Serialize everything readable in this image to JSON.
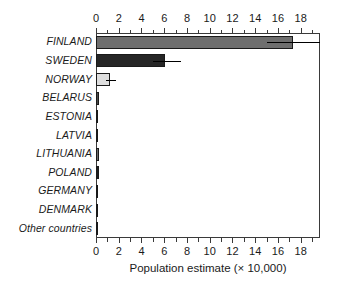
{
  "chart_data": {
    "type": "bar",
    "orientation": "horizontal",
    "title": "",
    "xlabel": "Population estimate (× 10,000)",
    "ylabel": "",
    "xlim": [
      0,
      19.7
    ],
    "grid": false,
    "legend": null,
    "axis_positions": [
      "top",
      "bottom"
    ],
    "tick_labels": [
      "0",
      "2",
      "4",
      "6",
      "8",
      "10",
      "12",
      "14",
      "16",
      "18"
    ],
    "tick_values": [
      0,
      2,
      4,
      6,
      8,
      10,
      12,
      14,
      16,
      18
    ],
    "minor_tick_values": [
      1,
      3,
      5,
      7,
      9,
      11,
      13,
      15,
      17,
      19
    ],
    "categories": [
      "FINLAND",
      "SWEDEN",
      "NORWAY",
      "BELARUS",
      "ESTONIA",
      "LATVIA",
      "LITHUANIA",
      "POLAND",
      "GERMANY",
      "DENMARK",
      "Other countries"
    ],
    "values": [
      17.3,
      6.1,
      1.2,
      0.22,
      0.16,
      0.12,
      0.28,
      0.24,
      0.2,
      0.1,
      0.1
    ],
    "error_low": [
      15.0,
      5.0,
      0.85,
      null,
      null,
      null,
      null,
      null,
      null,
      null,
      null
    ],
    "error_high": [
      19.7,
      7.5,
      1.75,
      null,
      null,
      null,
      null,
      null,
      null,
      null,
      null
    ],
    "bar_colors": [
      "#6e6e6e",
      "#262626",
      "#dedede",
      "#4a4a4a",
      "#3a3a3a",
      "#2e2e2e",
      "#6a6a6a",
      "#1e1e1e",
      "#4f4f4f",
      "#3a3a3a",
      "#2b2b2b"
    ],
    "bar_edge_color": "#1a1a1a",
    "error_bar_color": "#000000",
    "frame_color": "#3a3a3a",
    "background_color": "#ffffff"
  }
}
